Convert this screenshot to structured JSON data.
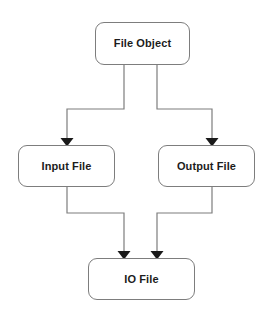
{
  "diagram": {
    "type": "flowchart",
    "background_color": "#ffffff",
    "node_fill_color": "#ffffff",
    "node_border_color": "#7d7d7d",
    "edge_color": "#7d7d7d",
    "arrowhead_color": "#1a1a1a",
    "text_color": "#1c1c1c",
    "nodes": [
      {
        "id": "file-object",
        "label": "File Object",
        "x": 95,
        "y": 22,
        "width": 95,
        "height": 43
      },
      {
        "id": "input-file",
        "label": "Input File",
        "x": 18,
        "y": 145,
        "width": 97,
        "height": 42
      },
      {
        "id": "output-file",
        "label": "Output File",
        "x": 158,
        "y": 145,
        "width": 97,
        "height": 42
      },
      {
        "id": "io-file",
        "label": "IO File",
        "x": 88,
        "y": 258,
        "width": 107,
        "height": 42
      }
    ],
    "edges": [
      {
        "id": "edge-file-object-to-input-file",
        "from": "file-object",
        "to": "input-file",
        "style": "orthogonal",
        "arrowhead": "solid-triangle"
      },
      {
        "id": "edge-file-object-to-output-file",
        "from": "file-object",
        "to": "output-file",
        "style": "orthogonal",
        "arrowhead": "solid-triangle"
      },
      {
        "id": "edge-input-file-to-io-file",
        "from": "input-file",
        "to": "io-file",
        "style": "orthogonal",
        "arrowhead": "solid-triangle"
      },
      {
        "id": "edge-output-file-to-io-file",
        "from": "output-file",
        "to": "io-file",
        "style": "orthogonal",
        "arrowhead": "solid-triangle"
      }
    ]
  }
}
